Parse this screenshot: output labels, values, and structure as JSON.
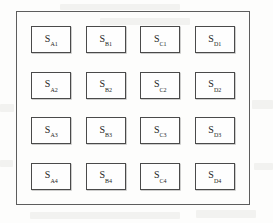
{
  "figure": {
    "background_color": "#fdfdfc",
    "frame_color": "#5d5d5d",
    "box_border_color": "#4a4a4a",
    "text_color": "#1c1c1c",
    "symbol": "S",
    "rows": 4,
    "columns": 4,
    "grid": [
      [
        {
          "symbol": "S",
          "subscript": "A1"
        },
        {
          "symbol": "S",
          "subscript": "B1"
        },
        {
          "symbol": "S",
          "subscript": "C1"
        },
        {
          "symbol": "S",
          "subscript": "D1"
        }
      ],
      [
        {
          "symbol": "S",
          "subscript": "A2"
        },
        {
          "symbol": "S",
          "subscript": "B2"
        },
        {
          "symbol": "S",
          "subscript": "C2"
        },
        {
          "symbol": "S",
          "subscript": "D2"
        }
      ],
      [
        {
          "symbol": "S",
          "subscript": "A3"
        },
        {
          "symbol": "S",
          "subscript": "B3"
        },
        {
          "symbol": "S",
          "subscript": "C3"
        },
        {
          "symbol": "S",
          "subscript": "D3"
        }
      ],
      [
        {
          "symbol": "S",
          "subscript": "A4"
        },
        {
          "symbol": "S",
          "subscript": "B4"
        },
        {
          "symbol": "S",
          "subscript": "C4"
        },
        {
          "symbol": "S",
          "subscript": "D4"
        }
      ]
    ]
  }
}
